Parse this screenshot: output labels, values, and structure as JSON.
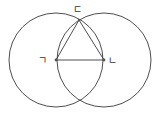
{
  "diagram": {
    "points": {
      "A": {
        "label": "ㄱ"
      },
      "B": {
        "label": "ㄴ"
      },
      "C": {
        "label": "ㄷ"
      }
    },
    "colors": {
      "stroke": "#3a3a3a",
      "point": "#555555",
      "background": "#ffffff"
    }
  }
}
